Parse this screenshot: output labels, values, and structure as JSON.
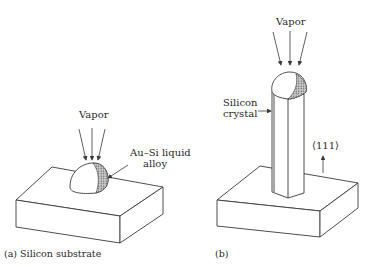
{
  "panel_a": {
    "vapor_label": "Vapor",
    "droplet_label_line1": "Au–Si liquid",
    "droplet_label_line2": "alloy",
    "caption": "(a)  Silicon substrate"
  },
  "panel_b": {
    "vapor_label": "Vapor",
    "crystal_label_line1": "Silicon",
    "crystal_label_line2": "crystal",
    "direction_label": "⟨111⟩",
    "caption": "(b)"
  },
  "colors": {
    "line": "#3a3a3a",
    "hatch": "#8a8a8a",
    "background": "#ffffff"
  }
}
